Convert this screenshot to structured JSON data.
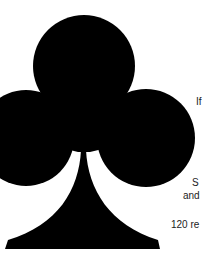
{
  "graphic": {
    "symbol": "club-suit-icon",
    "fill_color": "#000000",
    "background_color": "#ffffff"
  },
  "text_fragments": [
    {
      "id": "if",
      "text": "If"
    },
    {
      "id": "s",
      "text": "S"
    },
    {
      "id": "and",
      "text": "and"
    },
    {
      "id": "num",
      "text": "120 re"
    }
  ]
}
